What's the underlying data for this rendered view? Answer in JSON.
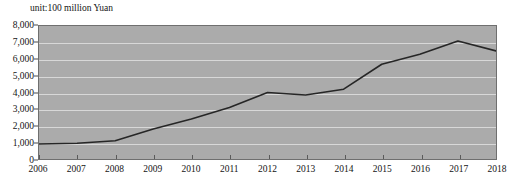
{
  "chart_data": {
    "type": "line",
    "title": "",
    "subtitle": "",
    "unit_label": "unit:100 million Yuan",
    "xlabel": "",
    "ylabel": "",
    "categories": [
      "2006",
      "2007",
      "2008",
      "2009",
      "2010",
      "2011",
      "2012",
      "2013",
      "2014",
      "2015",
      "2016",
      "2017",
      "2018"
    ],
    "x": [
      2006,
      2007,
      2008,
      2009,
      2010,
      2011,
      2012,
      2013,
      2014,
      2015,
      2016,
      2017,
      2018
    ],
    "values": [
      900,
      950,
      1100,
      1800,
      2400,
      3100,
      4000,
      3850,
      4200,
      5700,
      6300,
      7100,
      6500
    ],
    "series": [
      {
        "name": "",
        "values": [
          900,
          950,
          1100,
          1800,
          2400,
          3100,
          4000,
          3850,
          4200,
          5700,
          6300,
          7100,
          6500
        ]
      }
    ],
    "ylim": [
      0,
      8000
    ],
    "xlim": [
      2006,
      2018
    ],
    "ytick_labels": [
      "8,000",
      "7,000",
      "6,000",
      "5,000",
      "4,000",
      "3,000",
      "2,000",
      "1,000",
      "0"
    ],
    "ytick_values": [
      8000,
      7000,
      6000,
      5000,
      4000,
      3000,
      2000,
      1000,
      0
    ],
    "ytick_step": 1000,
    "xtick_labels": [
      "2006",
      "2007",
      "2008",
      "2009",
      "2010",
      "2011",
      "2012",
      "2013",
      "2014",
      "2015",
      "2016",
      "2017",
      "2018"
    ],
    "grid": true,
    "grid_orientation": "horizontal",
    "legend": false,
    "legend_position": "none",
    "annotations": [],
    "colors": {
      "plot_background": "#ababab",
      "gridline": "#d8d8d8",
      "line": "#262626",
      "axis": "#6f6f6f",
      "text": "#141414",
      "page_background": "#ffffff"
    }
  }
}
